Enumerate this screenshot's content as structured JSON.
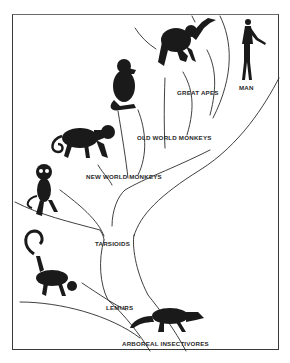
{
  "diagram": {
    "type": "phylogenetic-tree",
    "colors": {
      "ink": "#1a1a1a",
      "paper": "#ffffff",
      "frame": "#3a3a3a"
    },
    "labels": {
      "man": "MAN",
      "great_apes": "GREAT APES",
      "old_world_monkeys": "OLD WORLD MONKEYS",
      "new_world_monkeys": "NEW WORLD MONKEYS",
      "tarsioids": "TARSIOIDS",
      "lemurs": "LEMURS",
      "arboreal_insectivores": "ARBOREAL INSECTIVORES"
    },
    "figures": [
      "man-figure",
      "great-ape-figure",
      "old-world-monkey-figure",
      "new-world-monkey-figure",
      "tarsier-figure",
      "lemur-figure",
      "arboreal-insectivore-figure"
    ]
  }
}
